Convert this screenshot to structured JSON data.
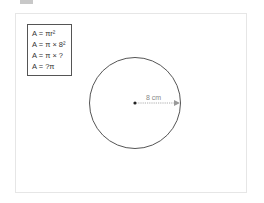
{
  "formulas": [
    "A = πr²",
    "A = π × 8²",
    "A = π × ?",
    "A = ?π"
  ],
  "circle": {
    "radius_label": "8 cm",
    "stroke_color": "#555555",
    "arrow_color": "#999999"
  }
}
